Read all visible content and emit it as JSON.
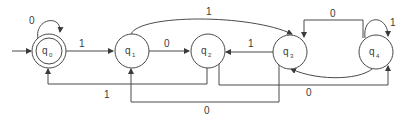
{
  "diagram": {
    "type": "finite-state-automaton",
    "colors": {
      "stroke": "#4a4a4a",
      "text": "#3a3a3a",
      "background": "#ffffff"
    },
    "start_state": "q0",
    "accepting_states": [
      "q0"
    ],
    "states": [
      {
        "id": "q0",
        "base": "q",
        "sub": "0",
        "accepting": true
      },
      {
        "id": "q1",
        "base": "q",
        "sub": "1",
        "accepting": false
      },
      {
        "id": "q2",
        "base": "q",
        "sub": "2",
        "accepting": false
      },
      {
        "id": "q3",
        "base": "q",
        "sub": "3",
        "accepting": false
      },
      {
        "id": "q4",
        "base": "q",
        "sub": "4",
        "accepting": false
      }
    ],
    "transitions": [
      {
        "from": "q0",
        "to": "q0",
        "label": "0"
      },
      {
        "from": "q0",
        "to": "q1",
        "label": "1"
      },
      {
        "from": "q1",
        "to": "q2",
        "label": "0"
      },
      {
        "from": "q1",
        "to": "q3",
        "label": "1"
      },
      {
        "from": "q3",
        "to": "q2",
        "label": "1"
      },
      {
        "from": "q4",
        "to": "q3",
        "label": "0"
      },
      {
        "from": "q4",
        "to": "q4",
        "label": "1"
      },
      {
        "from": "q2",
        "to": "q0",
        "label": "1"
      },
      {
        "from": "q3",
        "to": "q1",
        "label": "0"
      },
      {
        "from": "q2",
        "to": "q4",
        "label": "0"
      },
      {
        "from": "q4",
        "to": "q3",
        "label": ""
      }
    ]
  }
}
